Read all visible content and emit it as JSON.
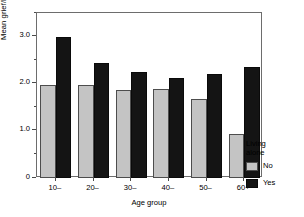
{
  "chart_data": {
    "type": "bar",
    "title": "",
    "subtitle": "",
    "xlabel": "Age group",
    "ylabel": "Mean grief/loneliness score",
    "categories": [
      "10–",
      "20–",
      "30–",
      "40–",
      "50–",
      "60+"
    ],
    "series": [
      {
        "name": "No",
        "color": "#c4c4c4",
        "values": [
          1.97,
          1.98,
          1.86,
          1.89,
          1.68,
          0.94
        ]
      },
      {
        "name": "Yes",
        "color": "#141414",
        "values": [
          3.0,
          2.45,
          2.25,
          2.13,
          2.21,
          2.36
        ]
      }
    ],
    "ylim": [
      0,
      3.5
    ],
    "ymajor_ticks": [
      0,
      1.0,
      2.0,
      3.0
    ],
    "ymajor_tick_labels": [
      "0",
      "1.0",
      "2.0",
      "3.0"
    ],
    "yminor_ticks": [
      0.5,
      1.5,
      2.5,
      3.5
    ],
    "grid": false,
    "legend_position": "right",
    "legend_title": "Living\nalone",
    "legend_entries": [
      "No",
      "Yes"
    ]
  },
  "axes": {
    "y_title": "Mean grief/loneliness score",
    "x_title": "Age group",
    "y_tick_labels": [
      "3.0",
      "2.0",
      "1.0",
      "0"
    ],
    "x_tick_labels": [
      "10–",
      "20–",
      "30–",
      "40–",
      "50–",
      "60+"
    ]
  },
  "legend": {
    "title": "Living\nalone",
    "items": [
      {
        "label": "No",
        "color": "#c4c4c4"
      },
      {
        "label": "Yes",
        "color": "#141414"
      }
    ]
  }
}
